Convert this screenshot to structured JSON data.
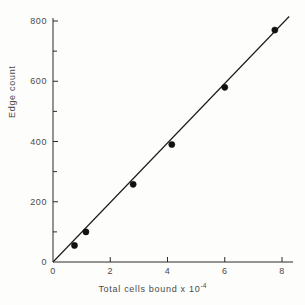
{
  "chart_data": {
    "type": "scatter",
    "title": "",
    "xlabel": "Total cells bound x 10",
    "xlabel_exponent": "-4",
    "ylabel": "Edge count",
    "xlim": [
      0,
      8.25
    ],
    "ylim": [
      0,
      815
    ],
    "xticks": [
      0,
      2,
      4,
      6,
      8
    ],
    "xtick_labels": [
      "0",
      "2",
      "4",
      "6",
      "8"
    ],
    "yticks": [
      0,
      200,
      400,
      600,
      800
    ],
    "ytick_labels": [
      "0",
      "200",
      "400",
      "600",
      "800"
    ],
    "y_minor_ticks": [
      100,
      300,
      500,
      700
    ],
    "grid": false,
    "legend": false,
    "marker": "filled-circle",
    "marker_color": "#111111",
    "line_color": "#1a1a1a",
    "points": [
      {
        "x": 0.75,
        "y": 55
      },
      {
        "x": 1.15,
        "y": 100
      },
      {
        "x": 2.8,
        "y": 258
      },
      {
        "x": 4.15,
        "y": 390
      },
      {
        "x": 6.0,
        "y": 580
      },
      {
        "x": 7.75,
        "y": 770
      }
    ],
    "fit_line": {
      "type": "linear",
      "x_start": 0,
      "y_start": 0,
      "x_end": 8.25,
      "y_end": 815
    }
  },
  "colors": {
    "ink": "#1a1a1a",
    "text": "#4a4a4a",
    "background": "#fdfdfc"
  }
}
